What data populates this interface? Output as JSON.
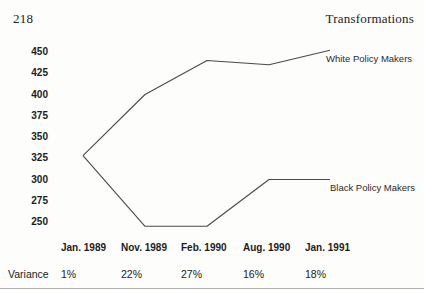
{
  "page": {
    "page_number": "218",
    "running_header": "Transformations"
  },
  "chart_data": {
    "type": "line",
    "title": "",
    "xlabel": "",
    "ylabel": "",
    "categories": [
      "Jan. 1989",
      "Nov. 1989",
      "Feb. 1990",
      "Aug. 1990",
      "Jan. 1991"
    ],
    "series": [
      {
        "name": "White Policy Makers",
        "values": [
          328,
          400,
          440,
          435,
          452
        ]
      },
      {
        "name": "Black Policy Makers",
        "values": [
          328,
          245,
          245,
          300,
          300
        ]
      }
    ],
    "y_ticks": [
      450,
      425,
      400,
      375,
      350,
      325,
      300,
      275,
      250
    ],
    "ylim": [
      240,
      460
    ],
    "grid": false,
    "legend_position": "inline-right-of-line-end",
    "line_color": "#4a4a4a"
  },
  "variance_row": {
    "label": "Variance",
    "values": [
      "1%",
      "22%",
      "27%",
      "16%",
      "18%"
    ]
  }
}
